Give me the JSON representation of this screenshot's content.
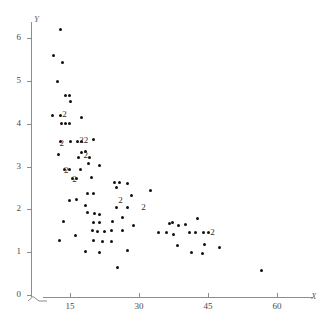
{
  "chart_data": {
    "type": "scatter",
    "title": "",
    "xlabel": "X",
    "ylabel": "Y",
    "xlim": [
      9.5,
      63
    ],
    "ylim": [
      0,
      6.55
    ],
    "grid": false,
    "legend": null,
    "xticks": [
      15,
      30,
      45,
      60
    ],
    "yticks": [
      0,
      1,
      2,
      3,
      4,
      5,
      6
    ],
    "axis_break": true,
    "points": [
      {
        "x": 13.0,
        "y": 6.2
      },
      {
        "x": 11.4,
        "y": 5.58
      },
      {
        "x": 13.4,
        "y": 5.42
      },
      {
        "x": 12.2,
        "y": 4.98
      },
      {
        "x": 14.0,
        "y": 4.65
      },
      {
        "x": 14.8,
        "y": 4.65
      },
      {
        "x": 15.0,
        "y": 4.52
      },
      {
        "x": 11.2,
        "y": 4.18
      },
      {
        "x": 13.0,
        "y": 4.18
      },
      {
        "x": 17.6,
        "y": 4.15
      },
      {
        "x": 13.2,
        "y": 4.0
      },
      {
        "x": 14.0,
        "y": 4.0
      },
      {
        "x": 14.8,
        "y": 4.0
      },
      {
        "x": 13.0,
        "y": 3.58
      },
      {
        "x": 15.0,
        "y": 3.58
      },
      {
        "x": 16.6,
        "y": 3.58
      },
      {
        "x": 17.6,
        "y": 3.58
      },
      {
        "x": 20.0,
        "y": 3.62
      },
      {
        "x": 17.4,
        "y": 3.33
      },
      {
        "x": 12.6,
        "y": 3.28
      },
      {
        "x": 16.8,
        "y": 3.22
      },
      {
        "x": 19.2,
        "y": 3.22
      },
      {
        "x": 18.4,
        "y": 3.36
      },
      {
        "x": 19.0,
        "y": 3.08
      },
      {
        "x": 21.4,
        "y": 3.02
      },
      {
        "x": 13.8,
        "y": 2.92
      },
      {
        "x": 14.8,
        "y": 2.92
      },
      {
        "x": 17.2,
        "y": 2.92
      },
      {
        "x": 15.6,
        "y": 2.72
      },
      {
        "x": 16.4,
        "y": 2.72
      },
      {
        "x": 19.6,
        "y": 2.75
      },
      {
        "x": 24.6,
        "y": 2.62
      },
      {
        "x": 25.8,
        "y": 2.62
      },
      {
        "x": 27.6,
        "y": 2.6
      },
      {
        "x": 25.0,
        "y": 2.5
      },
      {
        "x": 32.4,
        "y": 2.45
      },
      {
        "x": 18.8,
        "y": 2.38
      },
      {
        "x": 20.0,
        "y": 2.38
      },
      {
        "x": 28.4,
        "y": 2.32
      },
      {
        "x": 14.8,
        "y": 2.2
      },
      {
        "x": 16.4,
        "y": 2.22
      },
      {
        "x": 18.4,
        "y": 2.1
      },
      {
        "x": 25.0,
        "y": 2.05
      },
      {
        "x": 27.6,
        "y": 2.05
      },
      {
        "x": 18.8,
        "y": 1.92
      },
      {
        "x": 20.4,
        "y": 1.9
      },
      {
        "x": 21.4,
        "y": 1.88
      },
      {
        "x": 26.4,
        "y": 1.8
      },
      {
        "x": 42.8,
        "y": 1.78
      },
      {
        "x": 13.6,
        "y": 1.72
      },
      {
        "x": 20.2,
        "y": 1.7
      },
      {
        "x": 21.4,
        "y": 1.7
      },
      {
        "x": 24.2,
        "y": 1.72
      },
      {
        "x": 28.8,
        "y": 1.62
      },
      {
        "x": 36.6,
        "y": 1.68
      },
      {
        "x": 37.2,
        "y": 1.7
      },
      {
        "x": 38.6,
        "y": 1.62
      },
      {
        "x": 40.0,
        "y": 1.64
      },
      {
        "x": 19.8,
        "y": 1.5
      },
      {
        "x": 21.0,
        "y": 1.48
      },
      {
        "x": 22.6,
        "y": 1.48
      },
      {
        "x": 24.0,
        "y": 1.5
      },
      {
        "x": 26.4,
        "y": 1.5
      },
      {
        "x": 34.2,
        "y": 1.45
      },
      {
        "x": 36.0,
        "y": 1.45
      },
      {
        "x": 37.6,
        "y": 1.42
      },
      {
        "x": 41.0,
        "y": 1.45
      },
      {
        "x": 42.2,
        "y": 1.45
      },
      {
        "x": 44.0,
        "y": 1.45
      },
      {
        "x": 45.2,
        "y": 1.45
      },
      {
        "x": 12.8,
        "y": 1.28
      },
      {
        "x": 16.2,
        "y": 1.4
      },
      {
        "x": 20.2,
        "y": 1.28
      },
      {
        "x": 22.0,
        "y": 1.25
      },
      {
        "x": 24.0,
        "y": 1.25
      },
      {
        "x": 38.4,
        "y": 1.15
      },
      {
        "x": 44.2,
        "y": 1.18
      },
      {
        "x": 47.6,
        "y": 1.12
      },
      {
        "x": 18.4,
        "y": 1.02
      },
      {
        "x": 21.4,
        "y": 1.0
      },
      {
        "x": 27.6,
        "y": 1.05
      },
      {
        "x": 41.4,
        "y": 1.0
      },
      {
        "x": 43.8,
        "y": 0.98
      },
      {
        "x": 25.4,
        "y": 0.65
      },
      {
        "x": 56.6,
        "y": 0.58
      }
    ],
    "overlap_labels": [
      {
        "x": 13.8,
        "y": 4.22,
        "count": "2"
      },
      {
        "x": 13.2,
        "y": 3.55,
        "count": "2"
      },
      {
        "x": 18.0,
        "y": 3.62,
        "count": "22"
      },
      {
        "x": 18.4,
        "y": 3.28,
        "count": "2"
      },
      {
        "x": 14.2,
        "y": 2.92,
        "count": "2"
      },
      {
        "x": 16.0,
        "y": 2.7,
        "count": "2"
      },
      {
        "x": 26.0,
        "y": 2.22,
        "count": "2"
      },
      {
        "x": 31.0,
        "y": 2.05,
        "count": "2"
      },
      {
        "x": 46.0,
        "y": 1.48,
        "count": "2"
      }
    ]
  },
  "axis": {
    "y_title": "Y",
    "x_title": "X",
    "y_tick_labels": [
      "0",
      "1",
      "2",
      "3",
      "4",
      "5",
      "6"
    ],
    "x_tick_labels": [
      "15",
      "30",
      "45",
      "60"
    ]
  },
  "colors": {
    "point": "#111111",
    "axis": "#8c8c8c",
    "label": "#4a4a4a",
    "background": "#ffffff"
  }
}
